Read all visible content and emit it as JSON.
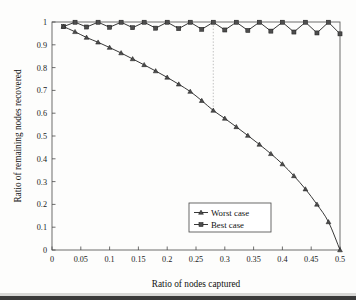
{
  "figure": {
    "background_color": "#fdfdfc",
    "frame_color": "#5d5d5d",
    "ink_color": "#141414",
    "annotation_color": "#b9b9b9"
  },
  "chart_data": {
    "type": "line",
    "title": "",
    "xlabel": "Ratio of nodes captured",
    "ylabel": "Ratio of remaining nodes recovered",
    "xlim": [
      0,
      0.5
    ],
    "ylim": [
      0,
      1
    ],
    "grid": false,
    "legend_position": "lower-center-right",
    "xticks": [
      0,
      0.05,
      0.1,
      0.15,
      0.2,
      0.25,
      0.3,
      0.35,
      0.4,
      0.45,
      0.5
    ],
    "xtick_labels": [
      "0",
      "0.05",
      "0.1",
      "0.15",
      "0.2",
      "0.25",
      "0.3",
      "0.35",
      "0.4",
      "0.45",
      "0.5"
    ],
    "yticks": [
      0,
      0.1,
      0.2,
      0.3,
      0.4,
      0.5,
      0.6,
      0.7,
      0.8,
      0.9,
      1
    ],
    "ytick_labels": [
      "0",
      "0.1",
      "0.2",
      "0.3",
      "0.4",
      "0.5",
      "0.6",
      "0.7",
      "0.8",
      "0.9",
      "1"
    ],
    "series": [
      {
        "name": "Worst case",
        "marker": "triangle",
        "x": [
          0.02,
          0.04,
          0.06,
          0.08,
          0.1,
          0.12,
          0.14,
          0.16,
          0.18,
          0.2,
          0.22,
          0.24,
          0.26,
          0.28,
          0.3,
          0.32,
          0.34,
          0.36,
          0.38,
          0.4,
          0.42,
          0.44,
          0.46,
          0.48,
          0.5
        ],
        "values": [
          0.98,
          0.957,
          0.932,
          0.911,
          0.888,
          0.864,
          0.838,
          0.812,
          0.785,
          0.757,
          0.727,
          0.695,
          0.655,
          0.612,
          0.577,
          0.54,
          0.502,
          0.463,
          0.422,
          0.377,
          0.325,
          0.267,
          0.2,
          0.123,
          0.0
        ]
      },
      {
        "name": "Best case",
        "marker": "square",
        "x": [
          0.02,
          0.04,
          0.06,
          0.08,
          0.1,
          0.12,
          0.14,
          0.16,
          0.18,
          0.2,
          0.22,
          0.24,
          0.26,
          0.28,
          0.3,
          0.32,
          0.34,
          0.36,
          0.38,
          0.4,
          0.42,
          0.44,
          0.46,
          0.48,
          0.5
        ],
        "values": [
          0.98,
          0.999,
          0.978,
          0.999,
          0.977,
          0.999,
          0.975,
          0.999,
          0.973,
          0.999,
          0.971,
          0.999,
          0.968,
          0.999,
          0.965,
          0.999,
          0.963,
          0.999,
          0.96,
          0.999,
          0.956,
          0.999,
          0.952,
          0.999,
          0.948
        ]
      }
    ],
    "annotations": [
      {
        "type": "vertical-dotted-line",
        "x": 0.28,
        "y_top": 0.999,
        "y_bottom": 0.612
      }
    ]
  },
  "legend": {
    "entries": [
      {
        "label": "Worst case",
        "marker": "triangle"
      },
      {
        "label": "Best case",
        "marker": "square"
      }
    ]
  }
}
